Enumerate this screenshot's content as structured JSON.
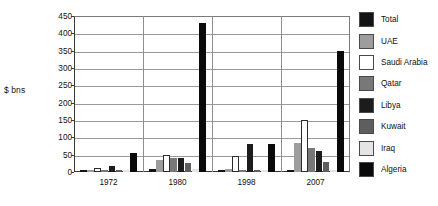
{
  "chart_data": {
    "type": "bar",
    "title": "",
    "subtitle": "",
    "xlabel": "",
    "ylabel": "$ bns",
    "ylim": [
      0,
      450
    ],
    "yticks": [
      0,
      50,
      100,
      150,
      200,
      250,
      300,
      350,
      400,
      450
    ],
    "grid": true,
    "legend_position": "right",
    "orientation": "vertical",
    "grouped": true,
    "categories": [
      "1972",
      "1980",
      "1998",
      "2007"
    ],
    "series": [
      {
        "name": "Total",
        "color": "#141414",
        "values": [
          4,
          9,
          5,
          6
        ]
      },
      {
        "name": "UAE",
        "color": "#9d9d9d",
        "values": [
          6,
          36,
          8,
          85
        ]
      },
      {
        "name": "Saudi Arabia",
        "color": "#ffffff",
        "values": [
          13,
          50,
          45,
          150
        ]
      },
      {
        "name": "Qatar",
        "color": "#787878",
        "values": [
          5,
          41,
          4,
          70
        ]
      },
      {
        "name": "Libya",
        "color": "#1c1c1c",
        "values": [
          17,
          41,
          80,
          62
        ]
      },
      {
        "name": "Kuwait",
        "color": "#5e5e5e",
        "values": [
          5,
          27,
          3,
          28
        ]
      },
      {
        "name": "Iraq",
        "color": "#e4e4e4",
        "values": [
          3,
          10,
          2,
          7
        ]
      },
      {
        "name": "Algeria",
        "color": "#0a0a0a",
        "values": [
          55,
          430,
          80,
          350
        ]
      }
    ]
  },
  "axis": {
    "y_title": "$ bns",
    "y_tick_labels": [
      "450",
      "400",
      "350",
      "300",
      "250",
      "200",
      "150",
      "100",
      "50",
      "0"
    ],
    "x_tick_labels": [
      "1972",
      "1980",
      "1998",
      "2007"
    ]
  },
  "legend": {
    "items": [
      {
        "label": "Total",
        "swatch": "#141414"
      },
      {
        "label": "UAE",
        "swatch": "#9d9d9d"
      },
      {
        "label": "Saudi Arabia",
        "swatch": "#ffffff"
      },
      {
        "label": "Qatar",
        "swatch": "#787878"
      },
      {
        "label": "Libya",
        "swatch": "#1c1c1c"
      },
      {
        "label": "Kuwait",
        "swatch": "#5e5e5e"
      },
      {
        "label": "Iraq",
        "swatch": "#e4e4e4"
      },
      {
        "label": "Algeria",
        "swatch": "#0a0a0a"
      }
    ]
  }
}
